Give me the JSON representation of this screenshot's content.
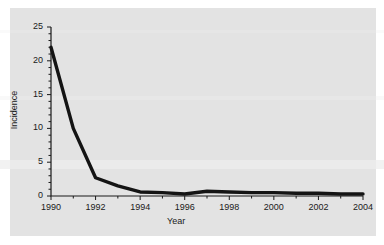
{
  "figure": {
    "background": "#ffffff",
    "panel_color": "#e3e3e3",
    "line_color": "#141414"
  },
  "chart_data": {
    "type": "line",
    "title": "",
    "xlabel": "Year",
    "ylabel": "Incidence",
    "xlim": [
      1990,
      2004
    ],
    "ylim": [
      0,
      25
    ],
    "grid": false,
    "legend": null,
    "x": [
      1990,
      1991,
      1992,
      1993,
      1994,
      1995,
      1996,
      1997,
      1998,
      1999,
      2000,
      2001,
      2002,
      2003,
      2004
    ],
    "values": [
      22.0,
      10.0,
      2.7,
      1.5,
      0.6,
      0.5,
      0.3,
      0.7,
      0.6,
      0.5,
      0.5,
      0.4,
      0.4,
      0.3,
      0.3
    ],
    "series": [
      {
        "name": "Incidence",
        "values": [
          22.0,
          10.0,
          2.7,
          1.5,
          0.6,
          0.5,
          0.3,
          0.7,
          0.6,
          0.5,
          0.5,
          0.4,
          0.4,
          0.3,
          0.3
        ]
      }
    ],
    "xticks": [
      1990,
      1992,
      1994,
      1996,
      1998,
      2000,
      2002,
      2004
    ],
    "xtick_labels": [
      "1990",
      "1992",
      "1994",
      "1996",
      "1998",
      "2000",
      "2002",
      "2004"
    ],
    "xminor_ticks": [
      1991,
      1993,
      1995,
      1997,
      1999,
      2001,
      2003
    ],
    "yticks": [
      0,
      5,
      10,
      15,
      20,
      25
    ],
    "ytick_labels": [
      "0",
      "5",
      "10",
      "15",
      "20",
      "25"
    ],
    "yminor_ticks": [
      1,
      2,
      3,
      4,
      6,
      7,
      8,
      9,
      11,
      12,
      13,
      14,
      16,
      17,
      18,
      19,
      21,
      22,
      23,
      24
    ]
  }
}
